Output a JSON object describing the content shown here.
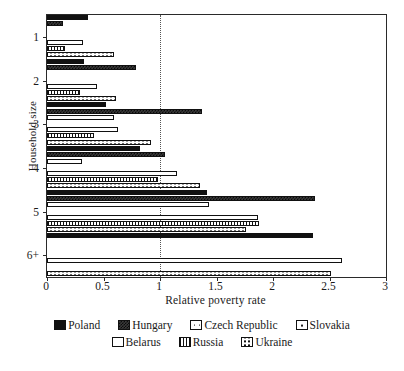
{
  "chart_data": {
    "type": "bar",
    "orientation": "horizontal",
    "title": "",
    "xlabel": "Relative poverty rate",
    "ylabel": "Household size",
    "categories": [
      "1",
      "2",
      "3",
      "4",
      "5",
      "6+"
    ],
    "xlim": [
      0,
      3
    ],
    "xticks": [
      "0",
      "0.5",
      "1",
      "1.5",
      "2",
      "2.5",
      "3"
    ],
    "xtick_values": [
      0,
      0.5,
      1,
      1.5,
      2,
      2.5,
      3
    ],
    "grid": false,
    "reference_line": 1,
    "legend_position": "bottom",
    "series": [
      {
        "name": "Poland",
        "pattern": "solid-black",
        "values": [
          0.36,
          0.33,
          0.52,
          0.82,
          1.42,
          2.35
        ]
      },
      {
        "name": "Hungary",
        "pattern": "dark-checker",
        "values": [
          0.14,
          0.79,
          1.37,
          1.04,
          2.37,
          null
        ]
      },
      {
        "name": "Czech Republic",
        "pattern": "fine-dots",
        "values": [
          null,
          null,
          0.59,
          0.31,
          1.43,
          null
        ]
      },
      {
        "name": "Slovakia",
        "pattern": "sparse-dots",
        "values": [
          null,
          null,
          null,
          null,
          null,
          null
        ]
      },
      {
        "name": "Belarus",
        "pattern": "white-open",
        "values": [
          0.32,
          0.44,
          0.63,
          1.15,
          1.87,
          2.61
        ]
      },
      {
        "name": "Russia",
        "pattern": "vertical-lines",
        "values": [
          0.16,
          0.29,
          0.42,
          0.98,
          1.88,
          null
        ]
      },
      {
        "name": "Ukraine",
        "pattern": "coarse-dots",
        "values": [
          0.59,
          0.61,
          0.92,
          1.35,
          1.76,
          2.51
        ]
      }
    ]
  },
  "legend": {
    "row1": [
      "Poland",
      "Hungary",
      "Czech Republic",
      "Slovakia"
    ],
    "row2": [
      "Belarus",
      "Russia",
      "Ukraine"
    ]
  }
}
